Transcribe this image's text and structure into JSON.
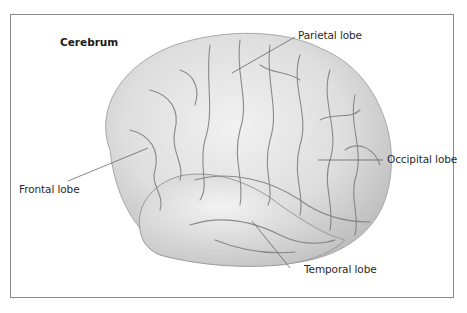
{
  "diagram": {
    "title": "Cerebrum",
    "labels": [
      {
        "id": "parietal",
        "text": "Parietal lobe"
      },
      {
        "id": "occipital",
        "text": "Occipital lobe"
      },
      {
        "id": "frontal",
        "text": "Frontal lobe"
      },
      {
        "id": "temporal",
        "text": "Temporal lobe"
      }
    ],
    "colors": {
      "border": "#8a8a8a",
      "brain_fill": "#dcdcdc",
      "brain_shadow": "#b9b9b9",
      "sulcus": "#6f6f6f",
      "leader_line": "#555555",
      "text": "#2a2a2a"
    }
  }
}
